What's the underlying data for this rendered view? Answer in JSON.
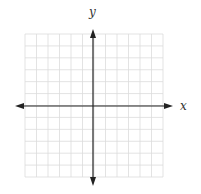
{
  "diagram": {
    "type": "coordinate-plane",
    "x_axis_label": "x",
    "y_axis_label": "y",
    "grid": {
      "columns": 12,
      "rows": 12,
      "left": 25,
      "top": 34,
      "right": 163,
      "bottom": 177,
      "line_color": "#dcdcdc",
      "axis_color": "#222222"
    },
    "origin": {
      "x": 93,
      "y": 106
    },
    "x_axis": {
      "from": 15,
      "to": 173
    },
    "y_axis": {
      "from": 29,
      "to": 186
    }
  }
}
